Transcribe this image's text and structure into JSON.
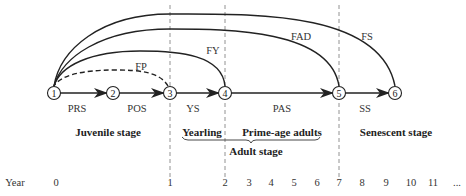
{
  "diagram": {
    "nodes": [
      {
        "id": "1",
        "label": "1",
        "x": 54
      },
      {
        "id": "2",
        "label": "2",
        "x": 113
      },
      {
        "id": "3",
        "label": "3",
        "x": 170
      },
      {
        "id": "4",
        "label": "4",
        "x": 225
      },
      {
        "id": "5",
        "label": "5",
        "x": 339
      },
      {
        "id": "6",
        "label": "6",
        "x": 395
      }
    ],
    "transitions": [
      {
        "from": "1",
        "to": "2",
        "label": "PRS"
      },
      {
        "from": "2",
        "to": "3",
        "label": "POS"
      },
      {
        "from": "3",
        "to": "4",
        "label": "YS"
      },
      {
        "from": "4",
        "to": "5",
        "label": "PAS"
      },
      {
        "from": "5",
        "to": "6",
        "label": "SS"
      }
    ],
    "fecundity_arcs": [
      {
        "from": "3",
        "to": "1",
        "label": "FP",
        "style": "dashed"
      },
      {
        "from": "4",
        "to": "1",
        "label": "FY",
        "style": "solid"
      },
      {
        "from": "5",
        "to": "1",
        "label": "FAD",
        "style": "solid"
      },
      {
        "from": "6",
        "to": "1",
        "label": "FS",
        "style": "solid"
      }
    ],
    "stages": {
      "juvenile": "Juvenile stage",
      "yearling": "Yearling",
      "prime_age": "Prime-age adults",
      "adult": "Adult stage",
      "senescent": "Senescent stage"
    },
    "year_axis": {
      "label": "Year",
      "ticks": [
        "0",
        "1",
        "2",
        "3",
        "4",
        "5",
        "6",
        "7",
        "8",
        "9",
        "10",
        "11",
        "..."
      ]
    }
  }
}
